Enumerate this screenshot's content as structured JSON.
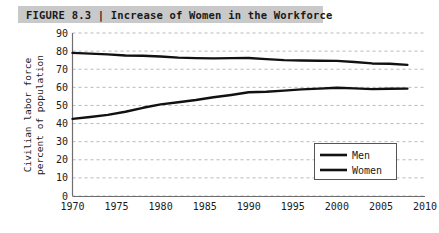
{
  "figure": {
    "label": "FIGURE 8.3",
    "separator": "|",
    "title": "Increase of Women in the Workforce",
    "full_title": "FIGURE 8.3 | Increase of Women in the Workforce",
    "title_bar_color": "#c9c9c9"
  },
  "chart_data": {
    "type": "line",
    "title": "Increase of Women in the Workforce",
    "xlabel": "",
    "ylabel": "Civilian labor force percent of population",
    "ylabel_line1": "Civilian labor force",
    "ylabel_line2": "percent of population",
    "xlim": [
      1970,
      2010
    ],
    "ylim": [
      0,
      90
    ],
    "xticks": [
      1970,
      1975,
      1980,
      1985,
      1990,
      1995,
      2000,
      2005,
      2010
    ],
    "yticks": [
      0,
      10,
      20,
      30,
      40,
      50,
      60,
      70,
      80,
      90
    ],
    "grid": true,
    "grid_style": "dashed-horizontal",
    "legend_position": "lower-right-inside",
    "line_color": "#111111",
    "x": [
      1970,
      1972,
      1974,
      1976,
      1978,
      1980,
      1982,
      1984,
      1986,
      1988,
      1990,
      1992,
      1994,
      1996,
      1998,
      2000,
      2002,
      2004,
      2006,
      2008
    ],
    "series": [
      {
        "name": "Men",
        "values": [
          79.0,
          78.6,
          78.2,
          77.6,
          77.4,
          77.0,
          76.4,
          76.1,
          76.0,
          76.1,
          76.2,
          75.6,
          75.0,
          74.8,
          74.7,
          74.6,
          74.0,
          73.2,
          73.0,
          72.4
        ]
      },
      {
        "name": "Women",
        "values": [
          42.6,
          43.6,
          44.8,
          46.5,
          48.7,
          50.6,
          51.8,
          53.0,
          54.5,
          55.8,
          57.3,
          57.6,
          58.2,
          58.9,
          59.3,
          59.8,
          59.4,
          59.0,
          59.2,
          59.3
        ]
      }
    ]
  },
  "legend": {
    "items": [
      {
        "label": "Men"
      },
      {
        "label": "Women"
      }
    ]
  },
  "axes": {
    "y_tick_labels": [
      "90",
      "80",
      "70",
      "60",
      "50",
      "40",
      "30",
      "20",
      "10",
      "0"
    ],
    "x_tick_labels": [
      "1970",
      "1975",
      "1980",
      "1985",
      "1990",
      "1995",
      "2000",
      "2005",
      "2010"
    ]
  }
}
